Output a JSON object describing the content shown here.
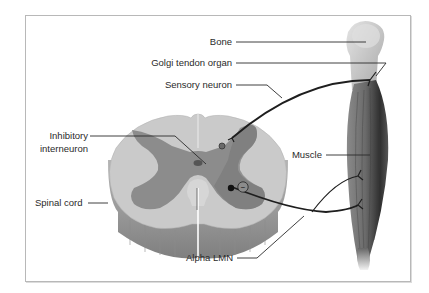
{
  "figure": {
    "labels": {
      "bone": "Bone",
      "golgi_tendon_organ": "Golgi tendon organ",
      "sensory_neuron": "Sensory neuron",
      "inhibitory_interneuron_line1": "Inhibitory",
      "inhibitory_interneuron_line2": "interneuron",
      "muscle": "Muscle",
      "spinal_cord": "Spinal cord",
      "alpha_lmn": "Alpha LMN"
    },
    "symbols": {
      "inhibitory_synapse": "(−)"
    },
    "colors": {
      "white_matter": "#c9c9c9",
      "gray_matter": "#8a8a8a",
      "cord_side": "#9e9e9e",
      "muscle_dark": "#5a5a5a",
      "bone": "#cfcfcf",
      "nerve_line": "#1e1e1e",
      "frame_border": "#b8b8b8"
    }
  }
}
